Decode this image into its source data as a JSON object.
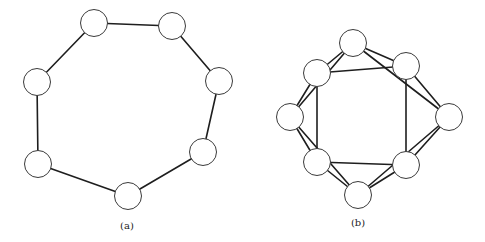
{
  "figure": {
    "background": "#ffffff",
    "edge_color": "#1e1e1e",
    "node_stroke_color": "#3a3a3a",
    "node_radius": 13.5,
    "graphs": [
      {
        "id": "a",
        "caption": "(a)",
        "caption_pos": {
          "x": 127,
          "y": 220
        },
        "nodes": [
          {
            "id": "a0",
            "x": 94,
            "y": 23
          },
          {
            "id": "a1",
            "x": 172,
            "y": 26
          },
          {
            "id": "a2",
            "x": 219,
            "y": 81
          },
          {
            "id": "a3",
            "x": 203,
            "y": 152
          },
          {
            "id": "a4",
            "x": 128,
            "y": 196
          },
          {
            "id": "a5",
            "x": 38,
            "y": 164
          },
          {
            "id": "a6",
            "x": 37,
            "y": 82
          }
        ],
        "edges": [
          [
            "a0",
            "a1"
          ],
          [
            "a1",
            "a2"
          ],
          [
            "a2",
            "a3"
          ],
          [
            "a3",
            "a4"
          ],
          [
            "a4",
            "a5"
          ],
          [
            "a5",
            "a6"
          ],
          [
            "a6",
            "a0"
          ]
        ]
      },
      {
        "id": "b",
        "caption": "(b)",
        "caption_pos": {
          "x": 358,
          "y": 217
        },
        "nodes": [
          {
            "id": "T",
            "x": 353,
            "y": 43
          },
          {
            "id": "UR",
            "x": 406,
            "y": 66
          },
          {
            "id": "R",
            "x": 449,
            "y": 117
          },
          {
            "id": "LR",
            "x": 406,
            "y": 165
          },
          {
            "id": "B",
            "x": 358,
            "y": 195
          },
          {
            "id": "LL",
            "x": 317,
            "y": 162
          },
          {
            "id": "L",
            "x": 290,
            "y": 117
          },
          {
            "id": "UL",
            "x": 317,
            "y": 73
          }
        ],
        "edges": [
          [
            "T",
            "UR"
          ],
          [
            "UR",
            "R"
          ],
          [
            "R",
            "LR"
          ],
          [
            "LR",
            "B"
          ],
          [
            "B",
            "LL"
          ],
          [
            "LL",
            "L"
          ],
          [
            "L",
            "UL"
          ],
          [
            "UL",
            "T"
          ],
          [
            "T",
            "R"
          ],
          [
            "R",
            "B"
          ],
          [
            "B",
            "L"
          ],
          [
            "L",
            "T"
          ],
          [
            "UL",
            "UR"
          ],
          [
            "UR",
            "LR"
          ],
          [
            "LR",
            "LL"
          ],
          [
            "LL",
            "UL"
          ]
        ]
      }
    ]
  }
}
